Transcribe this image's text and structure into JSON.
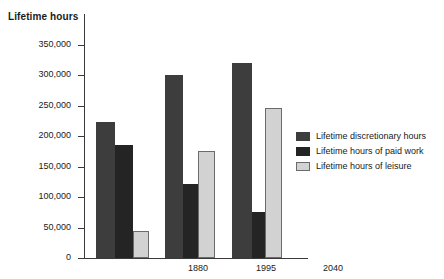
{
  "chart_data": {
    "type": "bar",
    "title": "Lifetime hours",
    "xlabel": "",
    "ylabel": "Lifetime hours",
    "categories": [
      "1880",
      "1995",
      "2040"
    ],
    "ylim": [
      0,
      350000
    ],
    "yticks": [
      0,
      50000,
      100000,
      150000,
      200000,
      250000,
      300000,
      350000
    ],
    "ytick_labels": [
      "0",
      "50,000",
      "100,000",
      "150,000",
      "200,000",
      "250,000",
      "300,000",
      "350,000"
    ],
    "grid": false,
    "legend_position": "right",
    "series": [
      {
        "name": "Lifetime discretionary hours",
        "color": "#3d3d3d",
        "values": [
          223000,
          300000,
          321000
        ]
      },
      {
        "name": "Lifetime hours of paid work",
        "color": "#242424",
        "values": [
          185000,
          121000,
          75000
        ]
      },
      {
        "name": "Lifetime hours of leisure",
        "color": "#d2d2d2",
        "values": [
          45000,
          176000,
          246000
        ]
      }
    ]
  },
  "axis_title": "Lifetime hours"
}
